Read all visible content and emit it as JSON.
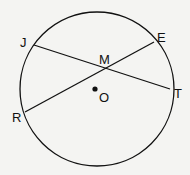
{
  "diagram": {
    "type": "circle-chords",
    "circle": {
      "center_label": "O",
      "cx": 97,
      "cy": 89,
      "r": 77
    },
    "points": {
      "J": {
        "label": "J",
        "x": 34,
        "y": 45
      },
      "E": {
        "label": "E",
        "x": 154,
        "y": 42
      },
      "M": {
        "label": "M",
        "x": 105,
        "y": 69
      },
      "T": {
        "label": "T",
        "x": 170,
        "y": 89
      },
      "R": {
        "label": "R",
        "x": 25,
        "y": 112
      },
      "O": {
        "label": "O",
        "x": 95,
        "y": 89
      }
    },
    "chords": [
      {
        "from": "J",
        "to": "T"
      },
      {
        "from": "R",
        "to": "E"
      }
    ],
    "colors": {
      "line": "#111111",
      "background": "#f4f4f2"
    }
  }
}
